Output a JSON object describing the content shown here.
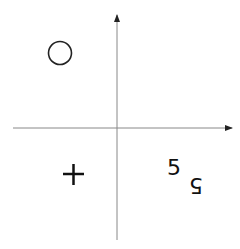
{
  "diagram": {
    "axes": {
      "x_axis": {
        "from": [
          13,
          128
        ],
        "to": [
          232,
          128
        ],
        "arrow": "right"
      },
      "y_axis": {
        "from": [
          117,
          240
        ],
        "to": [
          117,
          15
        ],
        "arrow": "up"
      },
      "color": "#888888"
    },
    "quadrants": {
      "top_left": {
        "symbol": "circle"
      },
      "top_right": {
        "symbol": ""
      },
      "bottom_left": {
        "symbol": "+"
      },
      "bottom_right": {
        "symbol": "5",
        "reflected_symbol": "5"
      }
    }
  }
}
